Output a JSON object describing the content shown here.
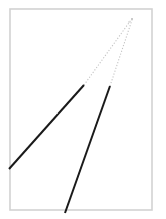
{
  "figure": {
    "canvas": {
      "width": 166,
      "height": 219,
      "background_color": "#ffffff"
    },
    "frame": {
      "label": "panel-border",
      "x": 10,
      "y": 9,
      "width": 142,
      "height": 201,
      "stroke_color": "#d2d2d2",
      "stroke_width": 1.6,
      "fill_color": "#ffffff"
    },
    "vanishing_point": {
      "label": "apex",
      "x": 132,
      "y": 19,
      "color": "#b8b8b8"
    },
    "lines": [
      {
        "name": "left-converging-line",
        "solid": {
          "x1": 9,
          "y1": 169,
          "x2": 84,
          "y2": 85,
          "color": "#1a1a1a",
          "width": 2.0,
          "dash": "none"
        },
        "dotted": {
          "x1": 84,
          "y1": 85,
          "x2": 131,
          "y2": 20,
          "color": "#c4c4c4",
          "width": 1.1,
          "dash": "1.2 1.8"
        }
      },
      {
        "name": "right-converging-line",
        "solid": {
          "x1": 65,
          "y1": 213,
          "x2": 110,
          "y2": 86,
          "color": "#1a1a1a",
          "width": 2.0,
          "dash": "none"
        },
        "dotted": {
          "x1": 110,
          "y1": 86,
          "x2": 132,
          "y2": 20,
          "color": "#c4c4c4",
          "width": 1.1,
          "dash": "1.2 1.8"
        }
      }
    ],
    "faint_marks": [
      {
        "name": "faint-speck-center",
        "x": 57,
        "y": 113,
        "r": 0.9,
        "color": "#ededed"
      },
      {
        "name": "faint-speck-apex",
        "x": 129,
        "y": 22,
        "r": 0.9,
        "color": "#d8d8d8"
      }
    ]
  }
}
